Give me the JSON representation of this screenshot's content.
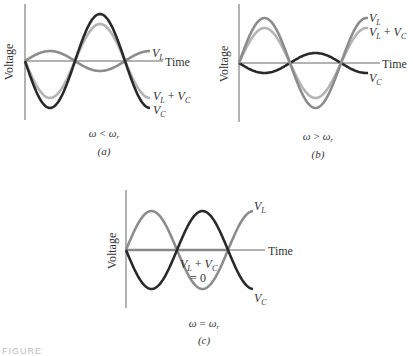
{
  "colors": {
    "v_l": "#8c8c8c",
    "v_c": "#2a2a2a",
    "sum": "#b4b4b4",
    "axis": "#666666"
  },
  "axes": {
    "ylabel": "Voltage",
    "xlabel": "Time"
  },
  "panels": [
    {
      "id": "a",
      "condition": "ω < ωr",
      "condition_parts": {
        "lhs": "ω",
        "op": "<",
        "rhs": "ω",
        "sub": "r"
      },
      "label": "(a)",
      "curves": {
        "v_l": "VL",
        "sum": "VL + VC",
        "v_c": "VC"
      }
    },
    {
      "id": "b",
      "condition": "ω > ωr",
      "condition_parts": {
        "lhs": "ω",
        "op": ">",
        "rhs": "ω",
        "sub": "r"
      },
      "label": "(b)",
      "curves": {
        "v_l": "VL",
        "sum": "VL + VC",
        "v_c": "VC"
      }
    },
    {
      "id": "c",
      "condition": "ω = ωr",
      "condition_parts": {
        "lhs": "ω",
        "op": "=",
        "rhs": "ω",
        "sub": "r"
      },
      "label": "(c)",
      "curves": {
        "v_l": "VL",
        "sum": "VL + VC",
        "sum_value": "= 0",
        "v_c": "VC"
      }
    }
  ],
  "text": {
    "a_cond_op": "<",
    "b_cond_op": ">",
    "c_cond_op": "=",
    "a_label": "(a)",
    "b_label": "(b)",
    "c_label": "(c)",
    "sum_zero": "= 0",
    "omega": "ω",
    "sub_r": "r",
    "V": "V",
    "L": "L",
    "C": "C",
    "plus": " + "
  },
  "footer_cut_text": "FIGURE"
}
